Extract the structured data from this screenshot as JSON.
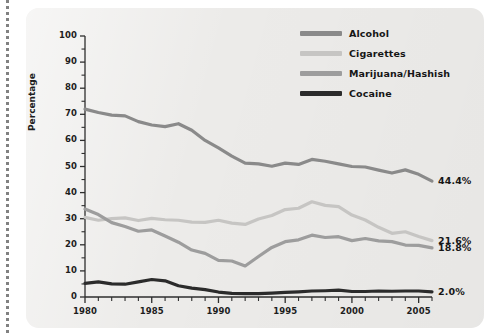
{
  "chart_data": {
    "type": "line",
    "title": "",
    "xlabel": "",
    "ylabel": "Percentage",
    "xlim": [
      1980,
      2006
    ],
    "ylim": [
      0,
      100
    ],
    "grid": false,
    "legend_position": "top-right",
    "xticks": [
      1980,
      1985,
      1990,
      1995,
      2000,
      2005
    ],
    "xtick_labels": [
      "1980",
      "1985",
      "1990",
      "1995",
      "2000",
      "2005"
    ],
    "xminor_step": 1,
    "yticks": [
      0,
      10,
      20,
      30,
      40,
      50,
      60,
      70,
      80,
      90,
      100
    ],
    "ytick_labels": [
      "0",
      "10",
      "20",
      "30",
      "40",
      "50",
      "60",
      "70",
      "80",
      "90",
      "100"
    ],
    "yminor_step": 5,
    "x": [
      1980,
      1981,
      1982,
      1983,
      1984,
      1985,
      1986,
      1987,
      1988,
      1989,
      1990,
      1991,
      1992,
      1993,
      1994,
      1995,
      1996,
      1997,
      1998,
      1999,
      2000,
      2001,
      2002,
      2003,
      2004,
      2005,
      2006
    ],
    "series": [
      {
        "name": "Alcohol",
        "color": "#8a8a8a",
        "end_label": "44.4%",
        "values": [
          72.0,
          70.7,
          69.7,
          69.4,
          67.2,
          65.9,
          65.3,
          66.4,
          63.9,
          60.0,
          57.1,
          54.0,
          51.3,
          51.0,
          50.1,
          51.3,
          50.8,
          52.7,
          52.0,
          51.0,
          50.0,
          49.8,
          48.6,
          47.5,
          48.7,
          47.0,
          44.4
        ]
      },
      {
        "name": "Cigarettes",
        "color": "#c6c5c3",
        "end_label": "21.6%",
        "values": [
          30.5,
          29.4,
          30.0,
          30.3,
          29.3,
          30.1,
          29.6,
          29.4,
          28.7,
          28.6,
          29.4,
          28.3,
          27.8,
          29.9,
          31.2,
          33.5,
          34.0,
          36.5,
          35.1,
          34.6,
          31.4,
          29.5,
          26.7,
          24.4,
          25.0,
          23.2,
          21.6
        ]
      },
      {
        "name": "Marijuana/Hashish",
        "color": "#9d9d9d",
        "end_label": "18.8%",
        "values": [
          33.7,
          31.6,
          28.5,
          27.0,
          25.2,
          25.7,
          23.4,
          21.0,
          18.0,
          16.7,
          14.0,
          13.8,
          11.9,
          15.5,
          19.0,
          21.2,
          21.9,
          23.7,
          22.8,
          23.1,
          21.6,
          22.4,
          21.5,
          21.2,
          19.9,
          19.8,
          18.8
        ]
      },
      {
        "name": "Cocaine",
        "color": "#2b2b2b",
        "end_label": "2.0%",
        "values": [
          5.2,
          5.8,
          5.0,
          4.9,
          5.8,
          6.7,
          6.2,
          4.3,
          3.4,
          2.8,
          1.9,
          1.4,
          1.3,
          1.3,
          1.5,
          1.8,
          2.0,
          2.3,
          2.4,
          2.6,
          2.1,
          2.1,
          2.3,
          2.2,
          2.3,
          2.3,
          2.0
        ]
      }
    ]
  }
}
